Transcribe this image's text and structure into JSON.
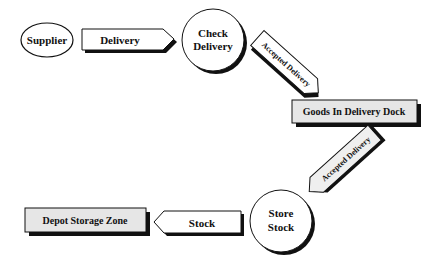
{
  "diagram": {
    "type": "process-flow",
    "nodes": {
      "supplier": {
        "label": "Supplier",
        "shape": "ellipse"
      },
      "delivery": {
        "label": "Delivery",
        "shape": "arrow-right"
      },
      "check_delivery": {
        "line1": "Check",
        "line2": "Delivery",
        "shape": "circle"
      },
      "accepted_delivery_1": {
        "label": "Accepted Delivery",
        "shape": "arrow-diagonal"
      },
      "goods_in": {
        "label": "Goods In Delivery Dock",
        "shape": "box"
      },
      "accepted_delivery_2": {
        "label": "Accepted Delivery",
        "shape": "arrow-diagonal"
      },
      "store_stock": {
        "line1": "Store",
        "line2": "Stock",
        "shape": "circle"
      },
      "stock": {
        "label": "Stock",
        "shape": "arrow-left"
      },
      "depot": {
        "label": "Depot Storage Zone",
        "shape": "box"
      }
    },
    "colors": {
      "box_fill": "#e6e6e6",
      "arrow_fill_light": "#f4f4f4",
      "outline": "#111111",
      "shadow": "#111111"
    }
  }
}
